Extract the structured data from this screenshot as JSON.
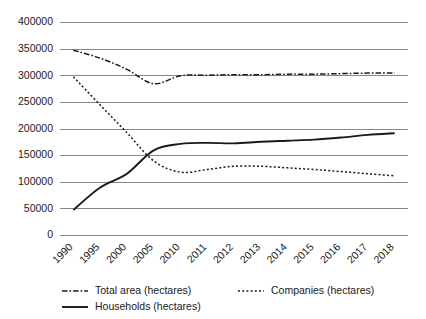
{
  "chart_data": {
    "type": "line",
    "title": "",
    "xlabel": "",
    "ylabel": "",
    "categories": [
      "1990",
      "1995",
      "2000",
      "2005",
      "2010",
      "2011",
      "2012",
      "2013",
      "2014",
      "2015",
      "2016",
      "2017",
      "2018"
    ],
    "ylim": [
      0,
      400000
    ],
    "ytick_values": [
      0,
      50000,
      100000,
      150000,
      200000,
      250000,
      300000,
      350000,
      400000
    ],
    "ytick_labels": [
      "0",
      "50000",
      "100000",
      "150000",
      "200000",
      "250000",
      "300000",
      "350000",
      "400000"
    ],
    "grid": true,
    "legend_position": "bottom",
    "series": [
      {
        "name": "Total area (hectares)",
        "style": "dashdot",
        "color": "#1a1a1a",
        "values": [
          348000,
          333000,
          312000,
          285000,
          300000,
          301000,
          302000,
          302000,
          303000,
          303000,
          304000,
          305000,
          305000
        ]
      },
      {
        "name": "Companies (hectares)",
        "style": "dotted",
        "color": "#1a1a1a",
        "values": [
          298000,
          245000,
          193000,
          140000,
          119000,
          124000,
          130000,
          130000,
          127000,
          124000,
          120000,
          116000,
          112000
        ]
      },
      {
        "name": "Households (hectares)",
        "style": "solid",
        "color": "#1a1a1a",
        "values": [
          48000,
          90000,
          116000,
          160000,
          172000,
          174000,
          173000,
          176000,
          178000,
          180000,
          184000,
          189000,
          192000
        ]
      }
    ]
  },
  "legend": {
    "entries": [
      {
        "label": "Total area (hectares)",
        "style": "dashdot"
      },
      {
        "label": "Companies (hectares)",
        "style": "dotted"
      },
      {
        "label": "Households (hectares)",
        "style": "solid"
      }
    ]
  }
}
